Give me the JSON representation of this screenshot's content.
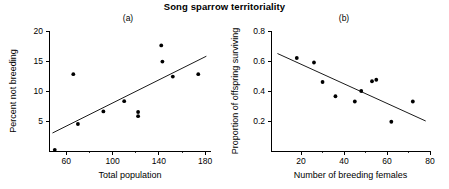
{
  "figure": {
    "title": "Song sparrow territoriality"
  },
  "panels": {
    "a": {
      "label": "(a)",
      "xlabel": "Total population",
      "ylabel": "Percent not breeding",
      "xticks": [
        "60",
        "100",
        "140",
        "180"
      ],
      "yticks": [
        "5",
        "10",
        "15",
        "20"
      ]
    },
    "b": {
      "label": "(b)",
      "xlabel": "Number of breeding females",
      "ylabel": "Proportion of offspring surviving",
      "xticks": [
        "20",
        "40",
        "60",
        "80"
      ],
      "yticks": [
        "0.2",
        "0.4",
        "0.6",
        "0.8"
      ]
    }
  },
  "chart_data": [
    {
      "type": "scatter",
      "panel": "(a)",
      "title": "Song sparrow territoriality",
      "xlabel": "Total population",
      "ylabel": "Percent not breeding",
      "xlim": [
        45,
        185
      ],
      "ylim": [
        0,
        20
      ],
      "xticks": [
        60,
        100,
        140,
        180
      ],
      "yticks": [
        5,
        10,
        15,
        20
      ],
      "xminor": [
        80,
        120,
        160
      ],
      "yminor": [],
      "grid": false,
      "legend": null,
      "points": [
        {
          "x": 50,
          "y": 0.2
        },
        {
          "x": 66,
          "y": 12.8
        },
        {
          "x": 70,
          "y": 4.5
        },
        {
          "x": 92,
          "y": 6.6
        },
        {
          "x": 110,
          "y": 8.3
        },
        {
          "x": 122,
          "y": 6.5
        },
        {
          "x": 122,
          "y": 5.8
        },
        {
          "x": 142,
          "y": 17.6
        },
        {
          "x": 143,
          "y": 14.9
        },
        {
          "x": 152,
          "y": 12.4
        },
        {
          "x": 174,
          "y": 12.8
        }
      ],
      "fit_line": {
        "x": [
          48,
          181
        ],
        "y": [
          3.0,
          15.8
        ],
        "style": "solid"
      }
    },
    {
      "type": "scatter",
      "panel": "(b)",
      "title": "Song sparrow territoriality",
      "xlabel": "Number of breeding females",
      "ylabel": "Proportion of offspring surviving",
      "xlim": [
        6,
        80
      ],
      "ylim": [
        0,
        0.8
      ],
      "xticks": [
        20,
        40,
        60,
        80
      ],
      "yticks": [
        0.2,
        0.4,
        0.6,
        0.8
      ],
      "xminor": [
        30,
        50,
        70
      ],
      "yminor": [],
      "grid": false,
      "legend": null,
      "points": [
        {
          "x": 18,
          "y": 0.62
        },
        {
          "x": 26,
          "y": 0.59
        },
        {
          "x": 30,
          "y": 0.46
        },
        {
          "x": 36,
          "y": 0.365
        },
        {
          "x": 45,
          "y": 0.33
        },
        {
          "x": 48,
          "y": 0.4
        },
        {
          "x": 53,
          "y": 0.465
        },
        {
          "x": 55,
          "y": 0.475
        },
        {
          "x": 62,
          "y": 0.195
        },
        {
          "x": 72,
          "y": 0.33
        }
      ],
      "fit_line": {
        "x": [
          9,
          78
        ],
        "y": [
          0.65,
          0.2
        ],
        "style": "solid"
      }
    }
  ]
}
